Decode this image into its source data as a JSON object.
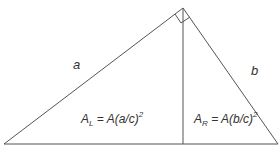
{
  "diagram": {
    "type": "right-triangle-altitude",
    "labels": {
      "side_a": "a",
      "side_b": "b",
      "area_left": {
        "main": "A",
        "sub": "L",
        "rest": " = A(a/c)",
        "sup": "2"
      },
      "area_right": {
        "main": "A",
        "sub": "R",
        "rest": " = A(b/c)",
        "sup": "2"
      }
    },
    "colors": {
      "stroke": "#555555",
      "text": "#333333",
      "background": "#ffffff"
    }
  }
}
